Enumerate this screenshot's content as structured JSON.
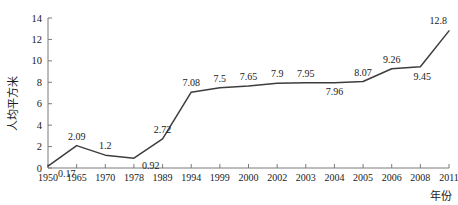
{
  "chart_data": {
    "type": "line",
    "title": "",
    "xlabel": "年份",
    "ylabel": "人均平方米",
    "categories": [
      "1950",
      "1965",
      "1970",
      "1978",
      "1989",
      "1994",
      "1999",
      "2000",
      "2002",
      "2003",
      "2004",
      "2005",
      "2006",
      "2008",
      "2011"
    ],
    "values": [
      0.17,
      2.09,
      1.2,
      0.92,
      2.72,
      7.08,
      7.5,
      7.65,
      7.9,
      7.95,
      7.96,
      8.07,
      9.26,
      9.45,
      12.8
    ],
    "point_labels": [
      "0.17",
      "2.09",
      "1.2",
      "0.92",
      "2.72",
      "7.08",
      "7.5",
      "7.65",
      "7.9",
      "7.95",
      "7.96",
      "8.07",
      "9.26",
      "9.45",
      "12.8"
    ],
    "label_positions": [
      "below",
      "above",
      "above",
      "below",
      "above",
      "above",
      "above",
      "above",
      "above",
      "above",
      "below",
      "above",
      "above",
      "below",
      "above"
    ],
    "ylim": [
      0,
      14
    ],
    "yticks": [
      0,
      2,
      4,
      6,
      8,
      10,
      12,
      14
    ],
    "ytick_labels": [
      "0",
      "2",
      "4",
      "6",
      "8",
      "10",
      "12",
      "14"
    ],
    "grid": false,
    "legend": "none",
    "line_color": "#3d3d3d",
    "axis_color": "#7a7a7a",
    "background": "#ffffff"
  }
}
